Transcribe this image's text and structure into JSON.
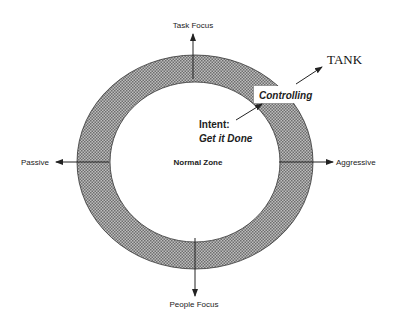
{
  "diagram": {
    "axes": {
      "top": "Task Focus",
      "bottom": "People Focus",
      "left": "Passive",
      "right": "Aggressive"
    },
    "center_label": "Normal Zone",
    "behavior_label": "Controlling",
    "intent_label": "Intent:",
    "intent_value": "Get it Done",
    "type_label": "TANK",
    "colors": {
      "ring_fill": "#9a9a9a",
      "stroke": "#222222",
      "background": "#ffffff"
    }
  }
}
